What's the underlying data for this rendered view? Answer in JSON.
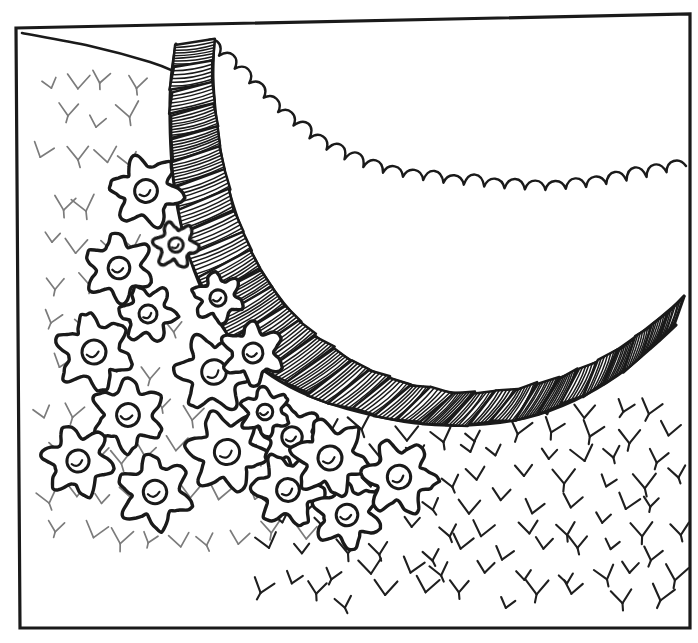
{
  "document": {
    "kind": "hand-drawn line illustration",
    "title": "Curved stone garden wall with flower border",
    "background_color": "#ffffff",
    "ink_color": "#1a1a1a",
    "canvas": {
      "width": 698,
      "height": 643
    }
  },
  "margin_text": {
    "left_edge_fragment": "e"
  },
  "frame": {
    "name": "illustration-border",
    "x": 16,
    "y": 22,
    "width": 674,
    "height": 606,
    "stroke_width": 3.2,
    "color": "#1a1a1a",
    "corners": {
      "top_left": [
        16,
        28
      ],
      "top_right": [
        690,
        14
      ],
      "bottom_right": [
        690,
        628
      ],
      "bottom_left": [
        20,
        628
      ]
    }
  },
  "scene": {
    "elements": [
      {
        "name": "upper-slope-line",
        "label": "Upper ground slope"
      },
      {
        "name": "garden-wall",
        "label": "Curved hatched stone wall"
      },
      {
        "name": "wall-far-edge",
        "label": "Scalloped far edge of wall"
      },
      {
        "name": "flower-bed",
        "label": "Cluster of six-petal flowers"
      },
      {
        "name": "grass-field",
        "label": "Y-shaped grass tick texture"
      }
    ]
  },
  "chart_data": {
    "type": "line",
    "xlabel": "",
    "ylabel": "",
    "xlim": [
      0,
      698
    ],
    "ylim": [
      0,
      643
    ],
    "grid": false,
    "legend": "none",
    "slope_line": {
      "name": "upper-slope-line",
      "points": [
        [
          22,
          33
        ],
        [
          90,
          46
        ],
        [
          150,
          62
        ],
        [
          178,
          73
        ]
      ]
    },
    "wall_outer_edge": {
      "name": "wall-outer-left-edge",
      "points": [
        [
          176,
          44
        ],
        [
          171,
          80
        ],
        [
          170,
          120
        ],
        [
          172,
          165
        ],
        [
          178,
          210
        ],
        [
          190,
          258
        ],
        [
          207,
          300
        ],
        [
          232,
          340
        ],
        [
          266,
          372
        ],
        [
          310,
          396
        ],
        [
          360,
          412
        ],
        [
          415,
          423
        ],
        [
          470,
          425
        ],
        [
          525,
          418
        ],
        [
          575,
          400
        ],
        [
          618,
          375
        ],
        [
          652,
          347
        ],
        [
          676,
          325
        ]
      ]
    },
    "wall_inner_edge": {
      "name": "wall-inner-right-edge",
      "points": [
        [
          214,
          40
        ],
        [
          213,
          78
        ],
        [
          216,
          118
        ],
        [
          222,
          160
        ],
        [
          233,
          205
        ],
        [
          250,
          250
        ],
        [
          275,
          292
        ],
        [
          308,
          330
        ],
        [
          350,
          360
        ],
        [
          400,
          382
        ],
        [
          455,
          393
        ],
        [
          510,
          391
        ],
        [
          560,
          378
        ],
        [
          606,
          357
        ],
        [
          645,
          330
        ],
        [
          672,
          308
        ],
        [
          684,
          296
        ]
      ]
    },
    "scalloped_far_edge": {
      "name": "wall-far-scalloped-edge",
      "bumps": 26,
      "points": [
        [
          203,
          43
        ],
        [
          232,
          66
        ],
        [
          258,
          92
        ],
        [
          282,
          116
        ],
        [
          306,
          136
        ],
        [
          330,
          152
        ],
        [
          356,
          165
        ],
        [
          384,
          173
        ],
        [
          414,
          179
        ],
        [
          446,
          183
        ],
        [
          478,
          186
        ],
        [
          512,
          189
        ],
        [
          546,
          190
        ],
        [
          580,
          188
        ],
        [
          612,
          183
        ],
        [
          642,
          178
        ],
        [
          668,
          172
        ],
        [
          686,
          166
        ]
      ],
      "bump_radius": 13
    },
    "wall_blocks": {
      "name": "wall-block-hatching",
      "count": 34,
      "description": "Stacked quadrilateral stones with diagonal hatch fill following the wall curve"
    },
    "flowers": {
      "name": "flower-bed",
      "petal_count": 6,
      "count": 18,
      "positions": [
        {
          "cx": 146,
          "cy": 191,
          "r": 38,
          "rot": 10
        },
        {
          "cx": 119,
          "cy": 268,
          "r": 36,
          "rot": 24
        },
        {
          "cx": 148,
          "cy": 314,
          "r": 30,
          "rot": 5
        },
        {
          "cx": 94,
          "cy": 352,
          "r": 40,
          "rot": 18
        },
        {
          "cx": 214,
          "cy": 372,
          "r": 41,
          "rot": 2
        },
        {
          "cx": 128,
          "cy": 415,
          "r": 38,
          "rot": 30
        },
        {
          "cx": 78,
          "cy": 461,
          "r": 37,
          "rot": 12
        },
        {
          "cx": 155,
          "cy": 492,
          "r": 39,
          "rot": 21
        },
        {
          "cx": 227,
          "cy": 452,
          "r": 42,
          "rot": 8
        },
        {
          "cx": 292,
          "cy": 437,
          "r": 34,
          "rot": 16
        },
        {
          "cx": 253,
          "cy": 353,
          "r": 33,
          "rot": 27
        },
        {
          "cx": 288,
          "cy": 490,
          "r": 38,
          "rot": 5
        },
        {
          "cx": 347,
          "cy": 515,
          "r": 36,
          "rot": 22
        },
        {
          "cx": 330,
          "cy": 458,
          "r": 40,
          "rot": 13
        },
        {
          "cx": 399,
          "cy": 477,
          "r": 39,
          "rot": 6
        },
        {
          "cx": 218,
          "cy": 298,
          "r": 27,
          "rot": 18
        },
        {
          "cx": 176,
          "cy": 245,
          "r": 24,
          "rot": 9
        },
        {
          "cx": 265,
          "cy": 412,
          "r": 26,
          "rot": 25
        }
      ],
      "center": {
        "shape": "circle-with-hook",
        "radius_ratio": 0.3
      }
    },
    "grass": {
      "name": "grass-field",
      "mark": "Y-tick",
      "left_region": {
        "opacity": 0.55,
        "rows": 12,
        "cols": 9,
        "note": "sparse, faded, upper-left"
      },
      "right_region": {
        "opacity": 1.0,
        "rows": 9,
        "cols": 11,
        "note": "dense, dark, lower-right"
      }
    }
  }
}
